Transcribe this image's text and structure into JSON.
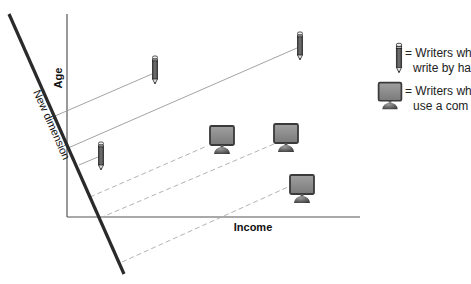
{
  "diagram": {
    "axes": {
      "y_label": "Age",
      "x_label": "Income"
    },
    "new_dimension_label": "New dimension",
    "legend": [
      {
        "icon": "pencil-icon",
        "line1": "= Writers wh",
        "line2": "write by ha"
      },
      {
        "icon": "computer-icon",
        "line1": "= Writers wh",
        "line2": "use a com"
      }
    ],
    "points": [
      {
        "type": "pencil",
        "group": "hand"
      },
      {
        "type": "pencil",
        "group": "hand"
      },
      {
        "type": "pencil",
        "group": "hand"
      },
      {
        "type": "computer",
        "group": "computer"
      },
      {
        "type": "computer",
        "group": "computer"
      },
      {
        "type": "computer",
        "group": "computer"
      }
    ],
    "colors": {
      "axis": "#555555",
      "new_dimension": "#2a2a2a",
      "solid_projection": "#999999",
      "dashed_projection": "#aaaaaa",
      "screen": "#8a8a8a",
      "screen_border": "#3a3a3a",
      "base": "#6a6a6a"
    }
  }
}
